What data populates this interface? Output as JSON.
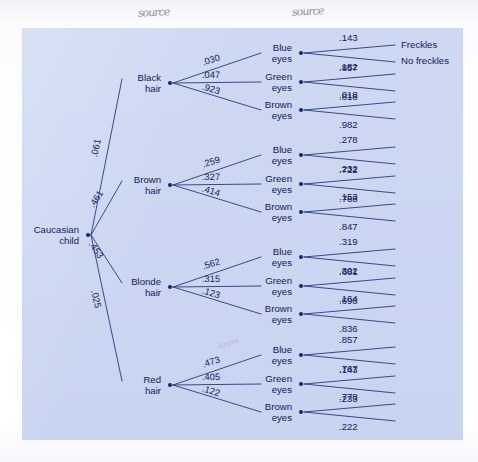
{
  "figure": {
    "title_handwritten_left": "source",
    "title_handwritten_right": "source",
    "annotation_faint": "know",
    "background_color": "#c9d4f1",
    "ink_color": "#10205e",
    "node_dot_color": "#17246b",
    "page_color": "#fdfdfd"
  },
  "chart_data": {
    "type": "diagram",
    "diagram_type": "probability-tree",
    "title": "",
    "root": {
      "label_line1": "Caucasian",
      "label_line2": "child",
      "x": 88,
      "y": 235
    },
    "level1_name": "hair color",
    "level2_name": "eye color",
    "level3_name": "freckles",
    "leaf_labels": [
      "Freckles",
      "No freckles"
    ],
    "branches": [
      {
        "label_line1": "Black",
        "label_line2": "hair",
        "prob": ".061",
        "x": 170,
        "y": 83,
        "children": [
          {
            "label_line1": "Blue",
            "label_line2": "eyes",
            "prob": ".030",
            "x": 301,
            "y": 53,
            "leaves": [
              ".143",
              ".857"
            ]
          },
          {
            "label_line1": "Green",
            "label_line2": "eyes",
            "prob": ".047",
            "x": 301,
            "y": 82,
            "leaves": [
              ".182",
              ".818"
            ]
          },
          {
            "label_line1": "Brown",
            "label_line2": "eyes",
            "prob": ".923",
            "x": 301,
            "y": 110,
            "leaves": [
              ".018",
              ".982"
            ]
          }
        ]
      },
      {
        "label_line1": "Brown",
        "label_line2": "hair",
        "prob": ".461",
        "x": 170,
        "y": 185,
        "children": [
          {
            "label_line1": "Blue",
            "label_line2": "eyes",
            "prob": ".259",
            "x": 301,
            "y": 155,
            "leaves": [
              ".278",
              ".722"
            ]
          },
          {
            "label_line1": "Green",
            "label_line2": "eyes",
            "prob": ".327",
            "x": 301,
            "y": 184,
            "leaves": [
              ".232",
              ".768"
            ]
          },
          {
            "label_line1": "Brown",
            "label_line2": "eyes",
            "prob": ".414",
            "x": 301,
            "y": 212,
            "leaves": [
              ".153",
              ".847"
            ]
          }
        ]
      },
      {
        "label_line1": "Blonde",
        "label_line2": "hair",
        "prob": ".453",
        "x": 170,
        "y": 287,
        "children": [
          {
            "label_line1": "Blue",
            "label_line2": "eyes",
            "prob": ".562",
            "x": 301,
            "y": 257,
            "leaves": [
              ".319",
              ".681"
            ]
          },
          {
            "label_line1": "Green",
            "label_line2": "eyes",
            "prob": ".315",
            "x": 301,
            "y": 286,
            "leaves": [
              ".302",
              ".698"
            ]
          },
          {
            "label_line1": "Brown",
            "label_line2": "eyes",
            "prob": ".123",
            "x": 301,
            "y": 314,
            "leaves": [
              ".164",
              ".836"
            ]
          }
        ]
      },
      {
        "label_line1": "Red",
        "label_line2": "hair",
        "prob": ".025",
        "x": 170,
        "y": 385,
        "children": [
          {
            "label_line1": "Blue",
            "label_line2": "eyes",
            "prob": ".473",
            "x": 301,
            "y": 355,
            "leaves": [
              ".857",
              ".143"
            ]
          },
          {
            "label_line1": "Green",
            "label_line2": "eyes",
            "prob": ".405",
            "x": 301,
            "y": 384,
            "leaves": [
              ".767",
              ".233"
            ]
          },
          {
            "label_line1": "Brown",
            "label_line2": "eyes",
            "prob": ".122",
            "x": 301,
            "y": 412,
            "leaves": [
              ".778",
              ".222"
            ]
          }
        ]
      }
    ]
  }
}
